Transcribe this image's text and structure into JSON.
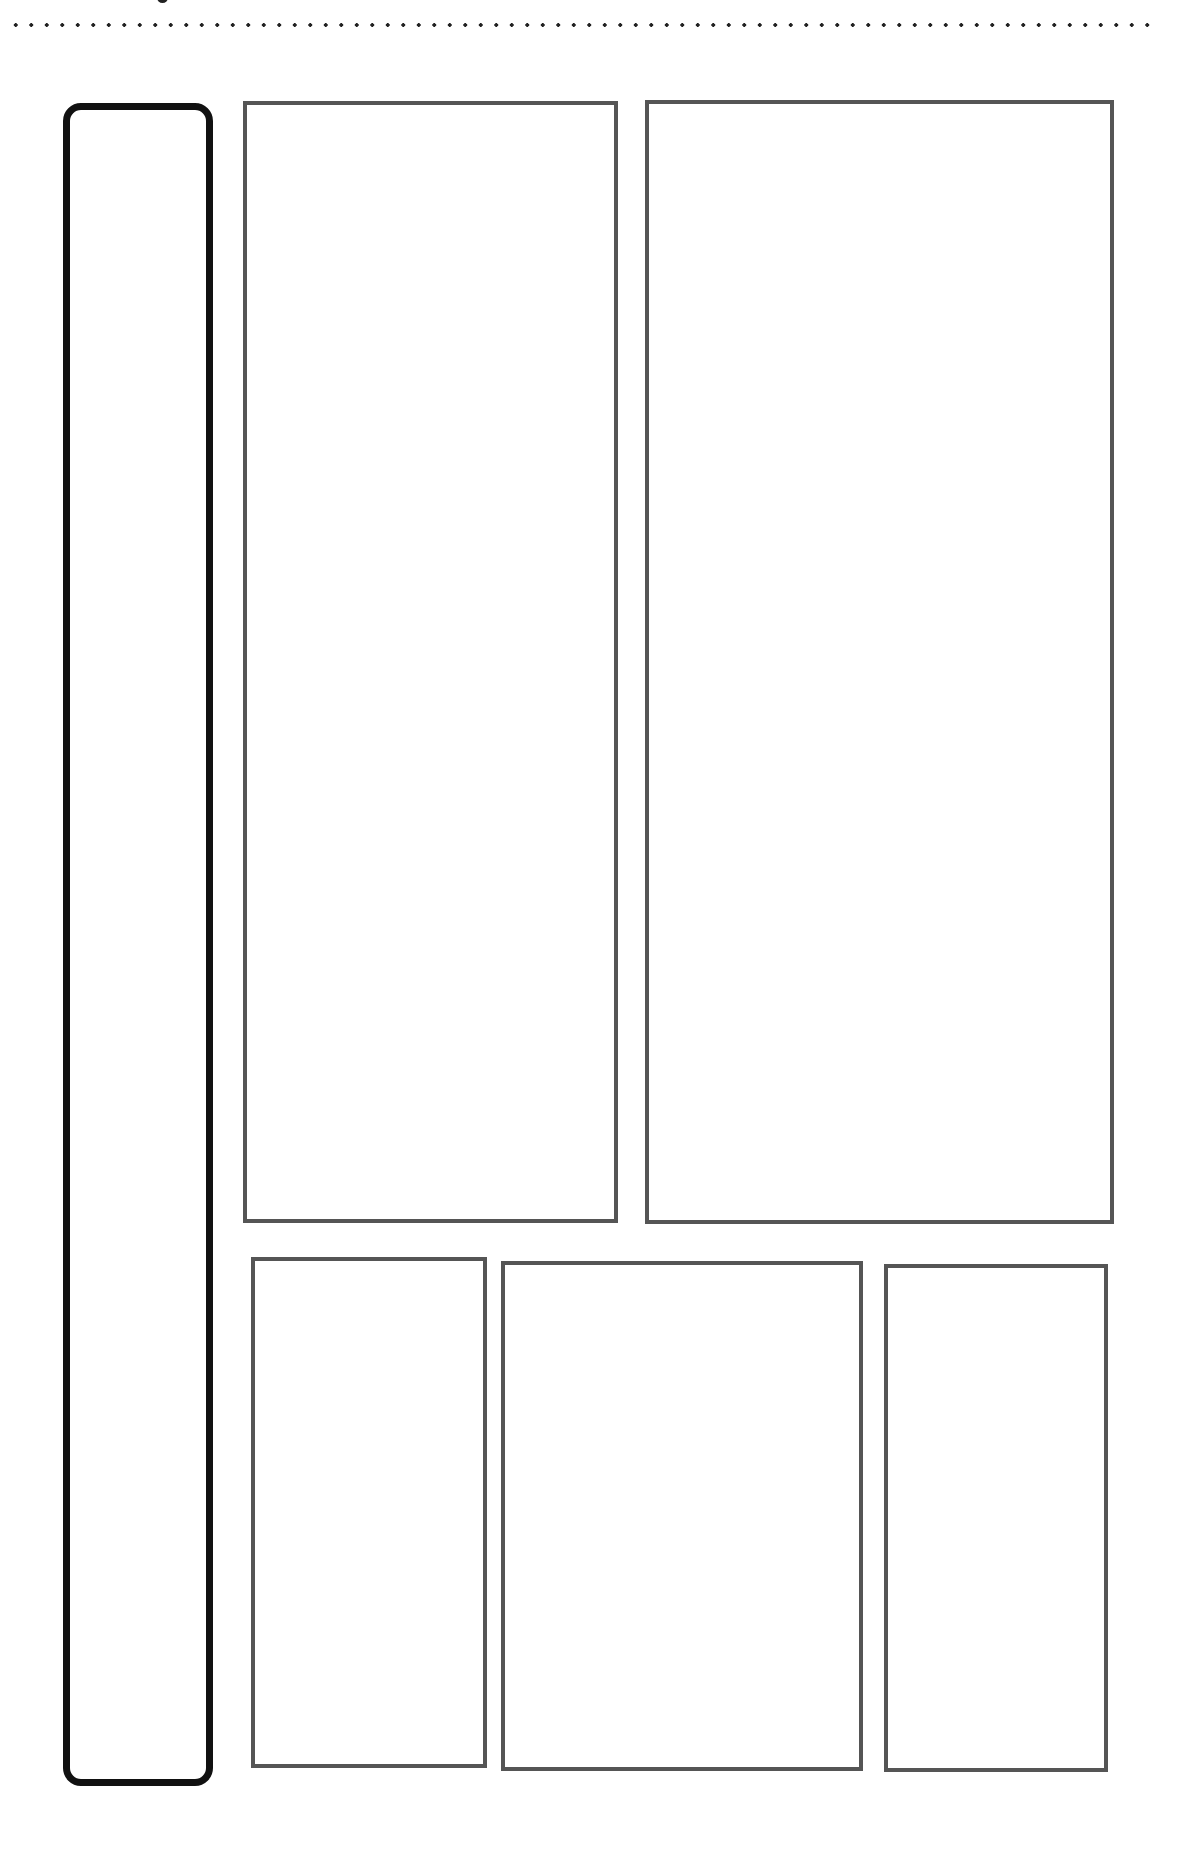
{
  "diagram": {
    "type": "wireframe-layout",
    "colors": {
      "background": "#ffffff",
      "sidebar_stroke": "#111111",
      "box_stroke": "#555555",
      "rule_dots": "#222222"
    },
    "header": {
      "separator": "dotted-rule",
      "clipped_glyph_fragment": true
    },
    "sidebar": {
      "shape": "rounded-rectangle",
      "label": ""
    },
    "top_row": [
      {
        "id": "top-left",
        "label": ""
      },
      {
        "id": "top-right",
        "label": ""
      }
    ],
    "bottom_row": [
      {
        "id": "bottom-left",
        "label": ""
      },
      {
        "id": "bottom-center",
        "label": ""
      },
      {
        "id": "bottom-right",
        "label": ""
      }
    ]
  }
}
